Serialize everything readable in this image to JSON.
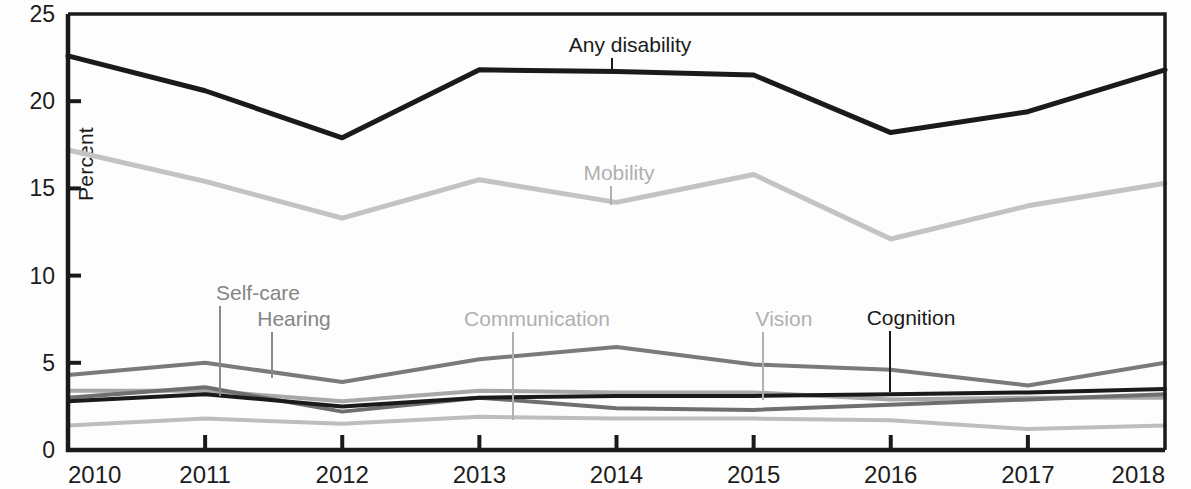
{
  "chart_data": {
    "type": "line",
    "title": "",
    "xlabel": "",
    "ylabel": "Percent",
    "x": [
      2010,
      2011,
      2012,
      2013,
      2014,
      2015,
      2016,
      2017,
      2018
    ],
    "xtick_labels": [
      "2010",
      "2011",
      "2012",
      "2013",
      "2014",
      "2015",
      "2016",
      "2017",
      "2018"
    ],
    "ytick_labels": [
      "0",
      "5",
      "10",
      "15",
      "20",
      "25"
    ],
    "ytick_values": [
      0,
      5,
      10,
      15,
      20,
      25
    ],
    "ylim": [
      0,
      25
    ],
    "xlim": [
      2010,
      2018
    ],
    "grid": false,
    "legend": "inline-annotations",
    "series": [
      {
        "name": "Any disability",
        "color": "#1a1a1a",
        "width": 5,
        "values": [
          22.6,
          20.6,
          17.9,
          21.8,
          21.7,
          21.5,
          18.2,
          19.4,
          21.8
        ]
      },
      {
        "name": "Mobility",
        "color": "#c3c3c3",
        "width": 5,
        "values": [
          17.2,
          15.4,
          13.3,
          15.5,
          14.2,
          15.8,
          12.1,
          14.0,
          15.3
        ]
      },
      {
        "name": "Hearing",
        "color": "#7a7a7a",
        "width": 4,
        "values": [
          4.3,
          5.0,
          3.9,
          5.2,
          5.9,
          4.9,
          4.6,
          3.7,
          5.0
        ]
      },
      {
        "name": "Cognition",
        "color": "#1a1a1a",
        "width": 4,
        "values": [
          2.8,
          3.2,
          2.5,
          3.0,
          3.1,
          3.1,
          3.2,
          3.3,
          3.5
        ]
      },
      {
        "name": "Self-care",
        "color": "#6f6f6f",
        "width": 4,
        "values": [
          3.0,
          3.6,
          2.2,
          3.0,
          2.4,
          2.3,
          2.6,
          2.9,
          3.2
        ]
      },
      {
        "name": "Communication",
        "color": "#a8a8a8",
        "width": 4,
        "values": [
          3.4,
          3.4,
          2.8,
          3.4,
          3.3,
          3.3,
          2.9,
          3.0,
          3.0
        ]
      },
      {
        "name": "Vision",
        "color": "#bdbdbd",
        "width": 4,
        "values": [
          1.4,
          1.8,
          1.5,
          1.9,
          1.8,
          1.8,
          1.7,
          1.2,
          1.4
        ]
      }
    ],
    "annotations": [
      {
        "label": "Any disability",
        "tone": "dark",
        "text_x": 630,
        "text_y": 52,
        "leader_x": 612,
        "leader_y1": 58,
        "leader_y2": 72
      },
      {
        "label": "Mobility",
        "tone": "light",
        "text_x": 619,
        "text_y": 180,
        "leader_x": 611,
        "leader_y1": 186,
        "leader_y2": 205
      },
      {
        "label": "Self-care",
        "tone": "med2",
        "text_x": 258,
        "text_y": 300,
        "leader_x": 220,
        "leader_y1": 306,
        "leader_y2": 396
      },
      {
        "label": "Hearing",
        "tone": "med2",
        "text_x": 294,
        "text_y": 326,
        "leader_x": 272,
        "leader_y1": 332,
        "leader_y2": 378
      },
      {
        "label": "Communication",
        "tone": "light",
        "text_x": 537,
        "text_y": 326,
        "leader_x": 513,
        "leader_y1": 332,
        "leader_y2": 420
      },
      {
        "label": "Vision",
        "tone": "light",
        "text_x": 784,
        "text_y": 326,
        "leader_x": 763,
        "leader_y1": 332,
        "leader_y2": 400
      },
      {
        "label": "Cognition",
        "tone": "dark",
        "text_x": 911,
        "text_y": 325,
        "leader_x": 890,
        "leader_y1": 331,
        "leader_y2": 392
      }
    ],
    "axis": {
      "left_px": 68,
      "right_px": 1165,
      "top_px": 14,
      "bottom_px": 450,
      "frame_color": "#1a1a1a"
    }
  }
}
